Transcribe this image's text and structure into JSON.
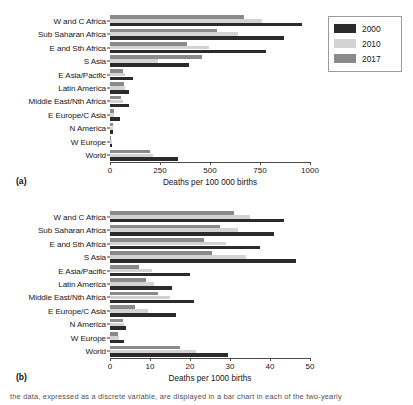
{
  "figure": {
    "panel_a_tag": "(a)",
    "panel_b_tag": "(b)",
    "caption_fragment": "the data, expressed as a discrete variable, are displayed in a bar chart in each of the two-yearly"
  },
  "legend": {
    "entries": [
      {
        "label": "2000",
        "color": "#2b2b2b",
        "name": "legend-swatch-2000"
      },
      {
        "label": "2010",
        "color": "#d3d3d3",
        "name": "legend-swatch-2010"
      },
      {
        "label": "2017",
        "color": "#8a8a8a",
        "name": "legend-swatch-2017"
      }
    ]
  },
  "chart_data": [
    {
      "type": "bar",
      "orientation": "horizontal",
      "panel": "(a)",
      "title": "",
      "xlabel": "Deaths per 100 000 births",
      "ylabel": "",
      "xlim": [
        0,
        1000
      ],
      "xticks": [
        0,
        250,
        500,
        750,
        1000
      ],
      "xtick_labels": [
        "0",
        "250",
        "500",
        "750",
        "1000"
      ],
      "grid": false,
      "legend_position": "right",
      "categories": [
        "W and C Africa",
        "Sub Saharan Africa",
        "E and Sth Africa",
        "S Asia",
        "E Asia/Pacific",
        "Latin America",
        "Middle East/Nth Africa",
        "E Europe/C Asia",
        "N America",
        "W Europe",
        "World"
      ],
      "series": [
        {
          "name": "2000",
          "color": "#2b2b2b",
          "values": [
            960,
            870,
            780,
            395,
            115,
            95,
            95,
            52,
            13,
            9,
            340
          ]
        },
        {
          "name": "2010",
          "color": "#d3d3d3",
          "values": [
            760,
            640,
            495,
            240,
            75,
            75,
            65,
            22,
            13,
            8,
            215
          ]
        },
        {
          "name": "2017",
          "color": "#8a8a8a",
          "values": [
            670,
            535,
            385,
            460,
            67,
            72,
            57,
            20,
            17,
            7,
            200
          ]
        }
      ]
    },
    {
      "type": "bar",
      "orientation": "horizontal",
      "panel": "(b)",
      "title": "",
      "xlabel": "Deaths per 1000 births",
      "ylabel": "",
      "xlim": [
        0,
        50
      ],
      "xticks": [
        0,
        10,
        20,
        30,
        40,
        50
      ],
      "xtick_labels": [
        "0",
        "10",
        "20",
        "30",
        "40",
        "50"
      ],
      "grid": false,
      "legend_position": "right",
      "categories": [
        "W and C Africa",
        "Sub Saharan Africa",
        "E and Sth Africa",
        "S Asia",
        "E Asia/Pacific",
        "Latin America",
        "Middle East/Nth Africa",
        "E Europe/C Asia",
        "N America",
        "W Europe",
        "World"
      ],
      "series": [
        {
          "name": "2000",
          "color": "#2b2b2b",
          "values": [
            43.5,
            41.0,
            37.5,
            46.5,
            20.0,
            15.5,
            21.0,
            16.5,
            4.0,
            3.4,
            29.5
          ]
        },
        {
          "name": "2010",
          "color": "#d3d3d3",
          "values": [
            35.0,
            32.0,
            29.0,
            34.0,
            10.5,
            11.0,
            15.0,
            9.5,
            3.5,
            2.3,
            21.5
          ]
        },
        {
          "name": "2017",
          "color": "#8a8a8a",
          "values": [
            31.0,
            27.5,
            23.5,
            25.5,
            7.3,
            9.0,
            12.0,
            6.3,
            3.2,
            2.0,
            17.5
          ]
        }
      ]
    }
  ]
}
